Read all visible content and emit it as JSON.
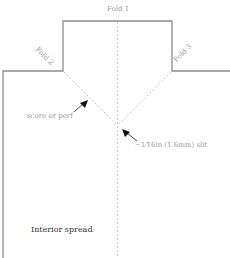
{
  "diagram": {
    "labels": {
      "fold1": "Fold 1",
      "fold2": "Fold 2",
      "fold3": "Fold 3",
      "score": "score or perf",
      "slit": "~1⁄16in (1.6mm) slit",
      "interior": "Interior spread"
    },
    "colors": {
      "outline": "#8c8c8c",
      "dashed": "#c8c8c8",
      "label": "#9a9a9a",
      "label_dark": "#333333",
      "arrow": "#111111"
    }
  }
}
